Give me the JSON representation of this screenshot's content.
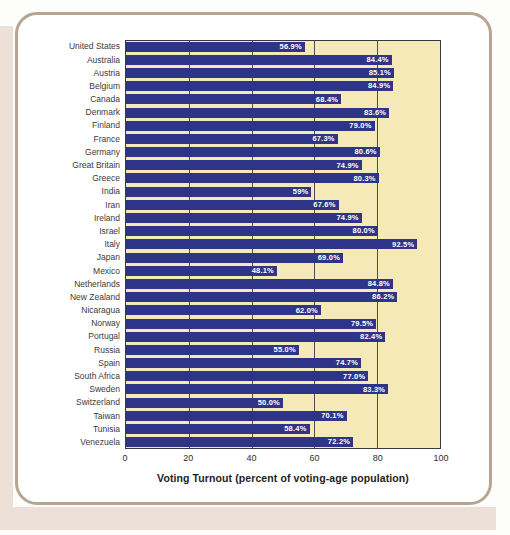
{
  "chart_data": {
    "type": "bar",
    "orientation": "horizontal",
    "title": "",
    "xlabel": "Voting Turnout (percent of voting-age population)",
    "ylabel": "",
    "xlim": [
      0,
      100
    ],
    "xticks": [
      0,
      20,
      40,
      60,
      80,
      100
    ],
    "gridlines": [
      20,
      40,
      60,
      80
    ],
    "grid": "vertical-on",
    "legend": "none",
    "categories": [
      "United States",
      "Australia",
      "Austria",
      "Belgium",
      "Canada",
      "Denmark",
      "Finland",
      "France",
      "Germany",
      "Great Britain",
      "Greece",
      "India",
      "Iran",
      "Ireland",
      "Israel",
      "Italy",
      "Japan",
      "Mexico",
      "Netherlands",
      "New Zealand",
      "Nicaragua",
      "Norway",
      "Portugal",
      "Russia",
      "Spain",
      "South Africa",
      "Sweden",
      "Switzerland",
      "Taiwan",
      "Tunisia",
      "Venezuela"
    ],
    "values": [
      56.9,
      84.4,
      85.1,
      84.9,
      68.4,
      83.6,
      79.0,
      67.3,
      80.6,
      74.9,
      80.3,
      59,
      67.6,
      74.9,
      80.0,
      92.5,
      69.0,
      48.1,
      84.8,
      86.2,
      62.0,
      79.5,
      82.4,
      55.0,
      74.7,
      77.0,
      83.3,
      50.0,
      70.1,
      58.4,
      72.2
    ],
    "value_labels": [
      "56.9%",
      "84.4%",
      "85.1%",
      "84.9%",
      "68.4%",
      "83.6%",
      "79.0%",
      "67.3%",
      "80.6%",
      "74.9%",
      "80.3%",
      "59%",
      "67.6%",
      "74.9%",
      "80.0%",
      "92.5%",
      "69.0%",
      "48.1%",
      "84.8%",
      "86.2%",
      "62.0%",
      "79.5%",
      "82.4%",
      "55.0%",
      "74.7%",
      "77.0%",
      "83.3%",
      "50.0%",
      "70.1%",
      "58.4%",
      "72.2%"
    ],
    "value_label_position": "inside-end",
    "colors": {
      "bar": "#2E3487",
      "plot_bg": "#F5E9B8",
      "grid": "#4D4D4D",
      "plot_border": "#3A3A3A",
      "card_bg": "#FFFFFF",
      "card_border": "#B7A591",
      "page_edge": "#EDE1D7",
      "label": "#3B3B3B",
      "tick": "#2E2E2E",
      "value_label": "#FFFFFF",
      "title": "#1E1E1E"
    }
  }
}
